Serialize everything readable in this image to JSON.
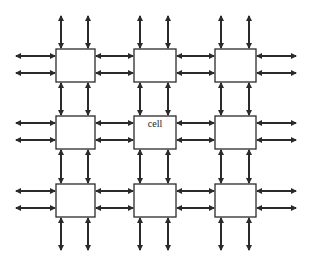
{
  "diagram": {
    "type": "mesh-network",
    "colors": {
      "background": "#ffffff",
      "stroke": "#2a2a2a",
      "box_fill": "#ffffff"
    },
    "columns_x": [
      [
        56,
        95
      ],
      [
        134,
        176
      ],
      [
        215,
        256
      ]
    ],
    "rows_y": [
      [
        49,
        82
      ],
      [
        116,
        149
      ],
      [
        184,
        217
      ]
    ],
    "vertical_arrow_x": [
      [
        61,
        88
      ],
      [
        140,
        168
      ],
      [
        221,
        249
      ]
    ],
    "horizontal_arrow_y": [
      [
        56,
        73
      ],
      [
        123,
        140
      ],
      [
        191,
        208
      ]
    ],
    "outer_extent": {
      "left": 16,
      "right": 296,
      "top": 16,
      "bottom": 250
    },
    "cells": [
      {
        "row": 0,
        "col": 0,
        "label": ""
      },
      {
        "row": 0,
        "col": 1,
        "label": ""
      },
      {
        "row": 0,
        "col": 2,
        "label": ""
      },
      {
        "row": 1,
        "col": 0,
        "label": ""
      },
      {
        "row": 1,
        "col": 1,
        "label": "cell"
      },
      {
        "row": 1,
        "col": 2,
        "label": ""
      },
      {
        "row": 2,
        "col": 0,
        "label": ""
      },
      {
        "row": 2,
        "col": 1,
        "label": ""
      },
      {
        "row": 2,
        "col": 2,
        "label": ""
      }
    ]
  }
}
